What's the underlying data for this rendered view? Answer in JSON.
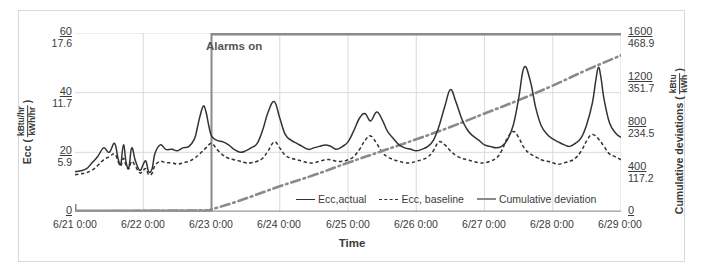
{
  "figure": {
    "annotation": "Alarms on"
  },
  "axes": {
    "x": {
      "title": "Time",
      "ticks": [
        "6/21 0:00",
        "6/22 0:00",
        "6/23 0:00",
        "6/24 0:00",
        "6/25 0:00",
        "6/26 0:00",
        "6/27 0:00",
        "6/28 0:00",
        "6/29 0:00"
      ]
    },
    "left": {
      "title": "Ecc (",
      "title_close": ")",
      "unit_num": "kBtu/hr",
      "unit_den": "kWh/hr",
      "ticks": [
        {
          "primary": "60",
          "secondary": "17.6"
        },
        {
          "primary": "40",
          "secondary": "11.7"
        },
        {
          "primary": "20",
          "secondary": "5.9"
        },
        {
          "primary": "0",
          "secondary": ""
        }
      ]
    },
    "right": {
      "title": "Cumulative deviations (",
      "title_close": ")",
      "unit_num": "kBtu",
      "unit_den": "kWh",
      "ticks": [
        {
          "primary": "1600",
          "secondary": "468.9"
        },
        {
          "primary": "1200",
          "secondary": "351.7"
        },
        {
          "primary": "800",
          "secondary": "234.5"
        },
        {
          "primary": "400",
          "secondary": "117.2"
        },
        {
          "primary": "0",
          "secondary": ""
        }
      ]
    }
  },
  "legend": {
    "items": [
      {
        "label": "Ecc,actual",
        "style": "solid",
        "color": "#333333"
      },
      {
        "label": "Ecc, baseline",
        "style": "dashed",
        "color": "#333333"
      },
      {
        "label": "Cumulative deviation",
        "style": "thick",
        "color": "#8a8a8a"
      }
    ]
  },
  "chart_data": {
    "type": "line",
    "title": "",
    "xlabel": "Time",
    "ylabel": "Ecc (kBtu/hr / kWh/hr)",
    "y2label": "Cumulative deviations (kBtu / kWh)",
    "ylim": [
      0,
      60
    ],
    "y2lim": [
      0,
      1600
    ],
    "grid": true,
    "legend_position": "bottom-center",
    "x_tick_labels": [
      "6/21 0:00",
      "6/22 0:00",
      "6/23 0:00",
      "6/24 0:00",
      "6/25 0:00",
      "6/26 0:00",
      "6/27 0:00",
      "6/28 0:00",
      "6/29 0:00"
    ],
    "x_domain_days": [
      0,
      8
    ],
    "annotations": [
      {
        "text": "Alarms on",
        "x": "6/23 0:00",
        "type": "vertical-line-with-top-rule",
        "color": "#8a8a8a"
      }
    ],
    "series": [
      {
        "name": "Ecc,actual",
        "axis": "left",
        "style": "solid",
        "color": "#333333",
        "x": [
          0,
          0.08,
          0.17,
          0.25,
          0.33,
          0.42,
          0.5,
          0.58,
          0.63,
          0.67,
          0.71,
          0.75,
          0.79,
          0.83,
          0.88,
          0.92,
          0.96,
          1.0,
          1.04,
          1.08,
          1.13,
          1.17,
          1.25,
          1.33,
          1.42,
          1.5,
          1.58,
          1.67,
          1.75,
          1.79,
          1.83,
          1.88,
          1.92,
          1.96,
          2.0,
          2.08,
          2.17,
          2.25,
          2.33,
          2.42,
          2.5,
          2.58,
          2.67,
          2.75,
          2.83,
          2.92,
          3.0,
          3.08,
          3.17,
          3.25,
          3.33,
          3.42,
          3.5,
          3.58,
          3.67,
          3.75,
          3.83,
          3.92,
          4.0,
          4.08,
          4.17,
          4.25,
          4.33,
          4.42,
          4.5,
          4.58,
          4.67,
          4.75,
          4.83,
          4.92,
          5.0,
          5.08,
          5.17,
          5.25,
          5.33,
          5.42,
          5.5,
          5.58,
          5.67,
          5.75,
          5.83,
          5.92,
          6.0,
          6.08,
          6.17,
          6.25,
          6.33,
          6.42,
          6.5,
          6.58,
          6.67,
          6.75,
          6.83,
          6.92,
          7.0,
          7.08,
          7.17,
          7.25,
          7.33,
          7.42,
          7.5,
          7.58,
          7.63,
          7.67,
          7.71,
          7.75,
          7.83,
          7.92,
          8.0
        ],
        "y": [
          13.5,
          13.8,
          14.5,
          16.5,
          18.5,
          21.5,
          20.0,
          23.0,
          18.0,
          16.0,
          22.5,
          16.5,
          15.0,
          21.5,
          17.5,
          15.0,
          14.0,
          16.0,
          17.0,
          13.5,
          14.5,
          19.5,
          22.5,
          21.0,
          21.0,
          20.5,
          21.5,
          22.0,
          24.5,
          28.0,
          32.0,
          35.5,
          33.5,
          29.0,
          25.5,
          24.0,
          23.5,
          22.5,
          21.0,
          20.0,
          20.5,
          21.5,
          23.0,
          27.5,
          33.5,
          37.0,
          31.5,
          26.0,
          24.0,
          23.0,
          22.0,
          21.0,
          21.5,
          22.0,
          22.5,
          22.0,
          21.0,
          22.0,
          23.5,
          27.0,
          31.5,
          33.0,
          30.5,
          33.5,
          31.0,
          27.0,
          24.5,
          22.5,
          21.5,
          21.0,
          20.5,
          21.0,
          22.0,
          24.0,
          28.5,
          35.5,
          41.0,
          37.0,
          31.0,
          27.5,
          25.5,
          24.0,
          22.5,
          22.0,
          21.5,
          22.0,
          24.0,
          29.0,
          38.0,
          48.5,
          44.0,
          35.0,
          29.0,
          26.0,
          24.5,
          23.5,
          22.5,
          22.0,
          23.0,
          25.0,
          29.5,
          36.5,
          44.0,
          48.5,
          44.5,
          38.0,
          30.0,
          26.5,
          25.0
        ],
        "peaks": [
          {
            "x": "6/23 ~14:00",
            "y": 35.5
          },
          {
            "x": "6/24 ~12:00",
            "y": 37.0
          },
          {
            "x": "6/25 ~12:00",
            "y": 33.5
          },
          {
            "x": "6/26 ~13:00",
            "y": 41.0
          },
          {
            "x": "6/27 ~12:00",
            "y": 48.5
          },
          {
            "x": "6/28 ~13:00",
            "y": 48.5
          }
        ]
      },
      {
        "name": "Ecc, baseline",
        "axis": "left",
        "style": "dashed",
        "color": "#333333",
        "x": [
          0,
          0.08,
          0.17,
          0.25,
          0.33,
          0.42,
          0.5,
          0.58,
          0.63,
          0.67,
          0.71,
          0.75,
          0.79,
          0.83,
          0.88,
          0.92,
          0.96,
          1.0,
          1.04,
          1.08,
          1.13,
          1.17,
          1.25,
          1.33,
          1.42,
          1.5,
          1.58,
          1.67,
          1.75,
          1.83,
          1.92,
          2.0,
          2.08,
          2.17,
          2.25,
          2.33,
          2.42,
          2.5,
          2.58,
          2.67,
          2.75,
          2.83,
          2.92,
          3.0,
          3.08,
          3.17,
          3.25,
          3.33,
          3.42,
          3.5,
          3.58,
          3.67,
          3.75,
          3.83,
          3.92,
          4.0,
          4.08,
          4.17,
          4.25,
          4.33,
          4.42,
          4.5,
          4.58,
          4.67,
          4.75,
          4.83,
          4.92,
          5.0,
          5.08,
          5.17,
          5.25,
          5.33,
          5.42,
          5.5,
          5.58,
          5.67,
          5.75,
          5.83,
          5.92,
          6.0,
          6.08,
          6.17,
          6.25,
          6.33,
          6.42,
          6.5,
          6.58,
          6.67,
          6.75,
          6.83,
          6.92,
          7.0,
          7.08,
          7.17,
          7.25,
          7.33,
          7.42,
          7.5,
          7.58,
          7.67,
          7.75,
          7.83,
          7.92,
          8.0
        ],
        "y": [
          12.5,
          12.8,
          13.2,
          14.0,
          15.5,
          17.5,
          18.5,
          19.5,
          17.0,
          15.5,
          18.0,
          15.5,
          14.5,
          17.0,
          15.5,
          14.0,
          13.0,
          14.0,
          14.5,
          12.5,
          13.0,
          15.5,
          17.0,
          16.5,
          16.5,
          16.0,
          16.5,
          17.0,
          18.0,
          19.5,
          21.5,
          23.0,
          21.0,
          19.0,
          18.0,
          17.5,
          17.0,
          16.5,
          16.5,
          17.0,
          18.0,
          20.5,
          23.5,
          21.5,
          19.0,
          18.0,
          17.5,
          17.0,
          16.5,
          16.5,
          17.0,
          17.5,
          17.5,
          17.0,
          17.0,
          17.5,
          18.5,
          21.0,
          24.0,
          25.5,
          23.0,
          20.0,
          18.5,
          17.5,
          17.0,
          16.5,
          16.5,
          17.0,
          17.5,
          18.5,
          20.5,
          23.5,
          22.5,
          20.5,
          19.0,
          18.0,
          17.5,
          17.0,
          16.5,
          16.5,
          17.0,
          18.0,
          20.5,
          24.5,
          27.0,
          25.0,
          21.5,
          19.5,
          18.5,
          17.5,
          17.0,
          16.5,
          16.0,
          16.5,
          17.0,
          18.0,
          20.5,
          24.0,
          26.0,
          24.5,
          22.0,
          19.5,
          18.5,
          17.5
        ]
      },
      {
        "name": "Cumulative deviation",
        "axis": "right",
        "style": "dash-dot",
        "color": "#8a8a8a",
        "x": [
          0,
          1.0,
          1.9,
          2.0,
          2.2,
          2.5,
          3.0,
          3.5,
          4.0,
          4.5,
          5.0,
          5.5,
          6.0,
          6.5,
          7.0,
          7.5,
          8.0
        ],
        "y": [
          5,
          10,
          15,
          25,
          60,
          120,
          230,
          330,
          440,
          545,
          650,
          760,
          880,
          1000,
          1130,
          1270,
          1400
        ]
      }
    ]
  }
}
